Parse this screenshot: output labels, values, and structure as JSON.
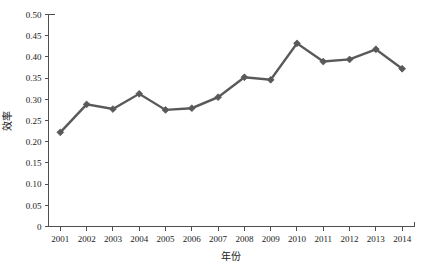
{
  "chart_data": {
    "type": "line",
    "title": "",
    "xlabel": "年份",
    "ylabel": "效率",
    "categories": [
      "2001",
      "2002",
      "2003",
      "2004",
      "2005",
      "2006",
      "2007",
      "2008",
      "2009",
      "2010",
      "2011",
      "2012",
      "2013",
      "2014"
    ],
    "values": [
      0.222,
      0.288,
      0.277,
      0.313,
      0.275,
      0.279,
      0.305,
      0.352,
      0.346,
      0.432,
      0.389,
      0.394,
      0.418,
      0.372
    ],
    "series": [
      {
        "name": "效率",
        "values": [
          0.222,
          0.288,
          0.277,
          0.313,
          0.275,
          0.279,
          0.305,
          0.352,
          0.346,
          0.432,
          0.389,
          0.394,
          0.418,
          0.372
        ]
      }
    ],
    "ylim": [
      0,
      0.5
    ],
    "xlim_labels": [
      "2001",
      "2014"
    ],
    "ytick_labels": [
      "0.50",
      "0.45",
      "0.40",
      "0.35",
      "0.30",
      "0.25",
      "0.20",
      "0.15",
      "0.10",
      "0.05",
      "0"
    ],
    "ytick_values": [
      0.5,
      0.45,
      0.4,
      0.35,
      0.3,
      0.25,
      0.2,
      0.15,
      0.1,
      0.05,
      0
    ],
    "grid": false,
    "legend": false,
    "legend_position": "none",
    "marker": "diamond",
    "line_color": "#595959",
    "marker_color": "#595959",
    "axis_color": "#4f4f4f",
    "background_color": "#ffffff"
  },
  "axis": {
    "x_title": "年份",
    "y_title": "效率"
  }
}
